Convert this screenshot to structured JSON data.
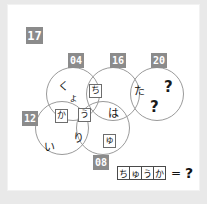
{
  "page": {
    "background_color": "#e9e9e9",
    "card_color": "#ffffff",
    "badge_color": "#8b8b8b",
    "stroke_color": "#9a9a9a"
  },
  "question": {
    "index_label": "17"
  },
  "venn": {
    "circles": [
      {
        "id": "04",
        "label": "04"
      },
      {
        "id": "16",
        "label": "16"
      },
      {
        "id": "20",
        "label": "20"
      },
      {
        "id": "12",
        "label": "12"
      },
      {
        "id": "08",
        "label": "08"
      }
    ],
    "kana": [
      {
        "id": "ku",
        "text": "く",
        "boxed": false
      },
      {
        "id": "yo",
        "text": "ょ",
        "boxed": false
      },
      {
        "id": "chi",
        "text": "ち",
        "boxed": true
      },
      {
        "id": "ka",
        "text": "か",
        "boxed": true
      },
      {
        "id": "u",
        "text": "う",
        "boxed": true
      },
      {
        "id": "ha",
        "text": "は",
        "boxed": false
      },
      {
        "id": "ri",
        "text": "り",
        "boxed": false
      },
      {
        "id": "yu",
        "text": "ゅ",
        "boxed": true
      },
      {
        "id": "i",
        "text": "い",
        "boxed": false
      },
      {
        "id": "ta",
        "text": "た",
        "boxed": false
      }
    ],
    "unknowns": [
      {
        "id": "q1",
        "text": "?"
      },
      {
        "id": "q2",
        "text": "?"
      }
    ]
  },
  "answer": {
    "cells": [
      "ち",
      "ゅ",
      "う",
      "か"
    ],
    "equals": "=",
    "result": "?"
  }
}
